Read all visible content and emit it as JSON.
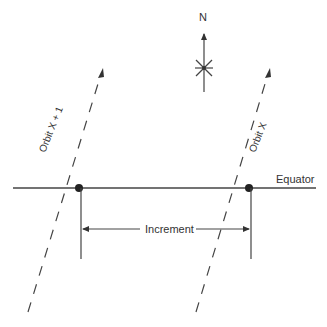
{
  "diagram": {
    "north_label": "N",
    "equator_label": "Equator",
    "increment_label": "Increment",
    "orbit_left_label": "Orbit X + 1",
    "orbit_right_label": "Orbit X",
    "line_color": "#444444"
  }
}
